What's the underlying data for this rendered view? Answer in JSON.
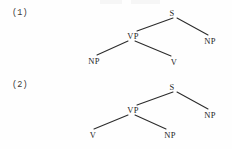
{
  "page": {
    "background_color": "#fefefe",
    "ink_color": "#2b2b2b",
    "width": 232,
    "height": 149
  },
  "figures": [
    {
      "label": "(1)",
      "description": "Binary branching tree: S dominates VP and NP; VP dominates NP and V",
      "nodes": {
        "s": "S",
        "vp": "VP",
        "np_right": "NP",
        "np_left": "NP",
        "v": "V"
      }
    },
    {
      "label": "(2)",
      "description": "Binary branching tree: S dominates VP and NP; VP dominates V and NP",
      "nodes": {
        "s": "S",
        "vp": "VP",
        "np_right": "NP",
        "v": "V",
        "np_bottom": "NP"
      }
    }
  ]
}
